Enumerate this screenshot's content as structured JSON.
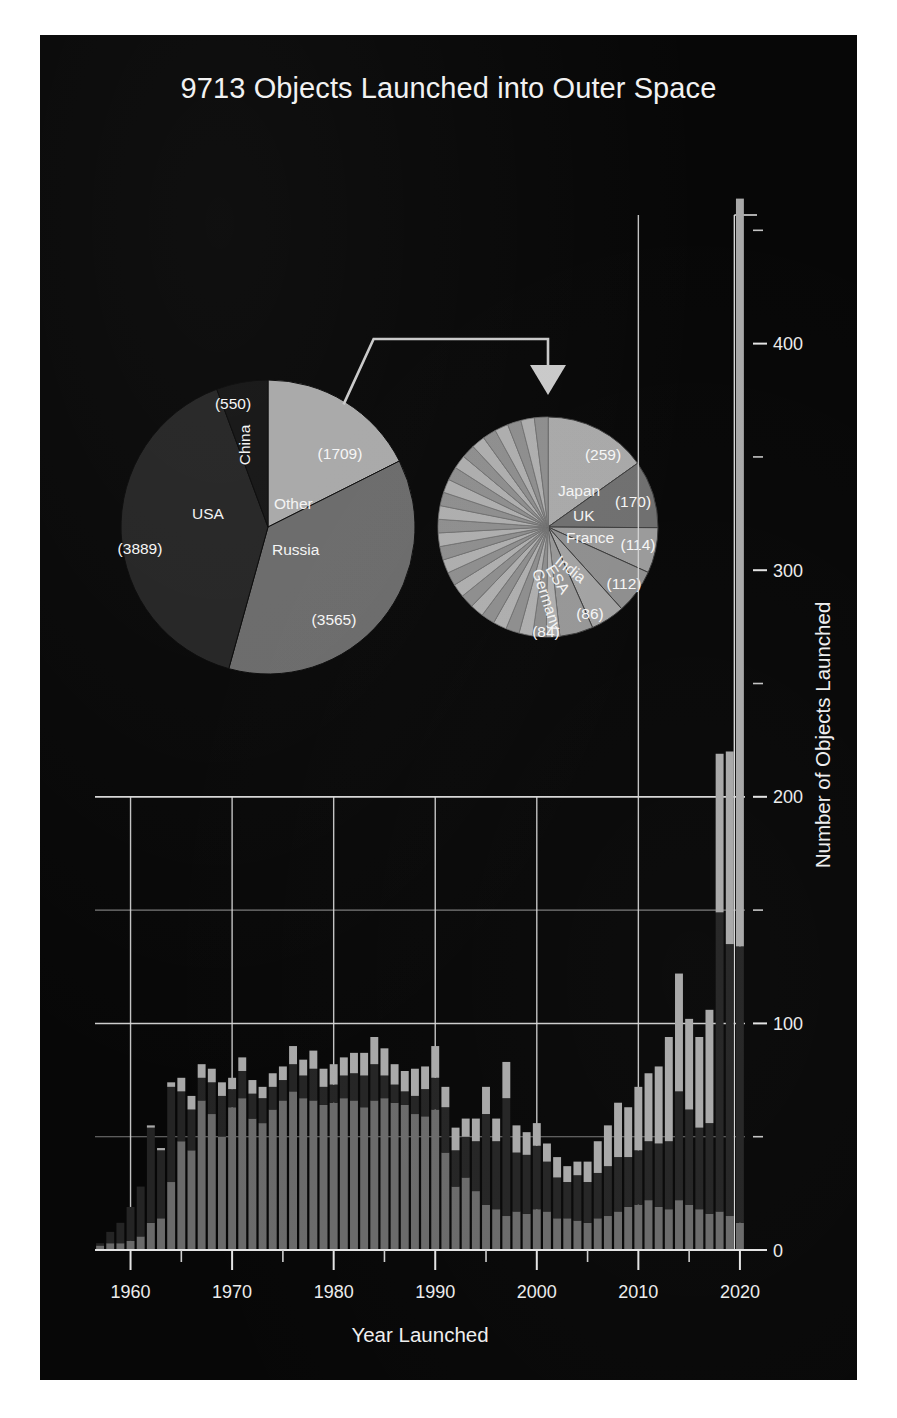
{
  "poster": {
    "title": "9713 Objects Launched into Outer Space",
    "background_color": "#070707",
    "text_color": "#f2f2f2"
  },
  "colors": {
    "usa": "#242424",
    "russia": "#6a6a6a",
    "other": "#a8a8a8",
    "china": "#141414",
    "grid": "#d8d8d8",
    "connector": "#c9c9c9"
  },
  "chart_data": [
    {
      "type": "pie",
      "name": "main-breakdown-pie",
      "title": "",
      "labels": [
        "USA",
        "Russia",
        "Other",
        "China"
      ],
      "values": [
        3889,
        3565,
        1709,
        550
      ],
      "value_labels": [
        "(3889)",
        "(3565)",
        "(1709)",
        "(550)"
      ],
      "colors": [
        "#242424",
        "#6a6a6a",
        "#a8a8a8",
        "#141414"
      ],
      "total": 9713
    },
    {
      "type": "pie",
      "name": "other-breakdown-pie",
      "title": "",
      "note": "Exploded detail of the 'Other' slice (1709 objects)",
      "labels": [
        "Japan",
        "UK",
        "France",
        "India",
        "ESA",
        "Germany"
      ],
      "values": [
        259,
        170,
        114,
        112,
        86,
        84
      ],
      "value_labels": [
        "(259)",
        "(170)",
        "(114)",
        "(112)",
        "(86)",
        "(84)"
      ],
      "remainder_label": "remaining countries",
      "remainder_value": 884,
      "colors": [
        "#a8a8a8",
        "#6f6f6f",
        "#9a9a9a",
        "#8e8e8e",
        "#a2a2a2",
        "#969696"
      ]
    },
    {
      "type": "bar",
      "name": "launches-by-year-stacked-bar",
      "stacked": true,
      "title": "",
      "xlabel": "Year Launched",
      "ylabel": "Number of Objects Launched",
      "xlim": [
        1957,
        2021
      ],
      "ylim": [
        0,
        470
      ],
      "ytick_labels": [
        "0",
        "100",
        "200",
        "300",
        "400"
      ],
      "yticks": [
        0,
        100,
        200,
        300,
        400
      ],
      "yminor": [
        50,
        150,
        250,
        350,
        450
      ],
      "xtick_labels": [
        "1960",
        "1970",
        "1980",
        "1990",
        "2000",
        "2010",
        "2020"
      ],
      "xticks": [
        1960,
        1970,
        1980,
        1990,
        2000,
        2010,
        2020
      ],
      "xminor": [
        1965,
        1975,
        1985,
        1995,
        2005,
        2015
      ],
      "grid": true,
      "legend": "none",
      "categories": [
        1957,
        1958,
        1959,
        1960,
        1961,
        1962,
        1963,
        1964,
        1965,
        1966,
        1967,
        1968,
        1969,
        1970,
        1971,
        1972,
        1973,
        1974,
        1975,
        1976,
        1977,
        1978,
        1979,
        1980,
        1981,
        1982,
        1983,
        1984,
        1985,
        1986,
        1987,
        1988,
        1989,
        1990,
        1991,
        1992,
        1993,
        1994,
        1995,
        1996,
        1997,
        1998,
        1999,
        2000,
        2001,
        2002,
        2003,
        2004,
        2005,
        2006,
        2007,
        2008,
        2009,
        2010,
        2011,
        2012,
        2013,
        2014,
        2015,
        2016,
        2017,
        2018,
        2019,
        2020
      ],
      "series": [
        {
          "name": "Russia",
          "color": "#6a6a6a",
          "values": [
            2,
            3,
            3,
            4,
            6,
            12,
            14,
            30,
            48,
            44,
            66,
            60,
            50,
            63,
            67,
            58,
            56,
            62,
            66,
            70,
            67,
            66,
            64,
            65,
            67,
            66,
            63,
            66,
            67,
            65,
            64,
            60,
            59,
            62,
            43,
            28,
            32,
            26,
            20,
            18,
            15,
            17,
            16,
            18,
            17,
            14,
            14,
            13,
            12,
            14,
            15,
            17,
            19,
            20,
            22,
            19,
            18,
            22,
            20,
            18,
            16,
            17,
            15,
            12
          ]
        },
        {
          "name": "USA",
          "color": "#242424",
          "values": [
            1,
            5,
            9,
            15,
            22,
            42,
            30,
            42,
            22,
            18,
            10,
            14,
            18,
            8,
            12,
            11,
            11,
            10,
            9,
            12,
            10,
            14,
            8,
            8,
            10,
            12,
            14,
            16,
            10,
            8,
            6,
            8,
            12,
            14,
            20,
            16,
            18,
            22,
            40,
            30,
            52,
            26,
            26,
            28,
            22,
            18,
            16,
            20,
            18,
            20,
            22,
            24,
            22,
            24,
            26,
            28,
            30,
            48,
            42,
            36,
            40,
            132,
            120,
            122
          ]
        },
        {
          "name": "Other",
          "color": "#a8a8a8",
          "values": [
            0,
            0,
            0,
            0,
            0,
            1,
            1,
            2,
            6,
            6,
            6,
            6,
            6,
            5,
            6,
            6,
            5,
            6,
            6,
            8,
            7,
            8,
            8,
            9,
            8,
            9,
            10,
            12,
            12,
            9,
            9,
            12,
            10,
            14,
            9,
            10,
            8,
            10,
            12,
            10,
            16,
            12,
            10,
            10,
            8,
            9,
            7,
            6,
            9,
            14,
            18,
            24,
            22,
            28,
            30,
            34,
            46,
            52,
            40,
            40,
            50,
            70,
            85,
            330
          ]
        }
      ]
    }
  ],
  "annotations": {
    "connector": {
      "name": "other-slice-callout",
      "description": "elbow connector with arrowhead linking 'Other' slice to detail pie"
    }
  }
}
